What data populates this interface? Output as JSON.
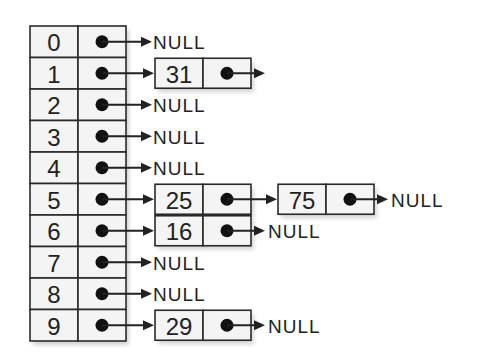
{
  "diagram": {
    "type": "hash-table-separate-chaining",
    "null_label": "NULL",
    "colors": {
      "stroke": "#2a2a2a",
      "cell_fill": "#f4f4f4",
      "text": "#222222",
      "pointer_dot": "#111111"
    },
    "buckets": [
      {
        "index": "0",
        "chain": [],
        "terminates_null": true
      },
      {
        "index": "1",
        "chain": [
          "31"
        ],
        "terminates_null": false
      },
      {
        "index": "2",
        "chain": [],
        "terminates_null": true
      },
      {
        "index": "3",
        "chain": [],
        "terminates_null": true
      },
      {
        "index": "4",
        "chain": [],
        "terminates_null": true
      },
      {
        "index": "5",
        "chain": [
          "25",
          "75"
        ],
        "terminates_null": true
      },
      {
        "index": "6",
        "chain": [
          "16"
        ],
        "terminates_null": true
      },
      {
        "index": "7",
        "chain": [],
        "terminates_null": true
      },
      {
        "index": "8",
        "chain": [],
        "terminates_null": true
      },
      {
        "index": "9",
        "chain": [
          "29"
        ],
        "terminates_null": true
      }
    ]
  }
}
